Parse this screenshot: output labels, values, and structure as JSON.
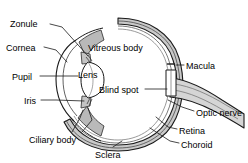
{
  "diagram": {
    "type": "anatomical-cross-section",
    "colors": {
      "outline": "#1a1a1a",
      "wall_fill": "#c8c8c8",
      "interior_fill": "#ffffff",
      "lens_fill": "#ffffff",
      "iris_fill": "#b4b4b4",
      "nerve_fill": "#d2d2d2",
      "text": "#000000",
      "background": "#ffffff"
    },
    "labels": [
      {
        "id": "zonule",
        "text": "Zonule",
        "x": 10,
        "y": 19,
        "align": "left"
      },
      {
        "id": "cornea",
        "text": "Cornea",
        "x": 6,
        "y": 43,
        "align": "left"
      },
      {
        "id": "pupil",
        "text": "Pupil",
        "x": 12,
        "y": 72,
        "align": "left"
      },
      {
        "id": "iris",
        "text": "Iris",
        "x": 24,
        "y": 96,
        "align": "left"
      },
      {
        "id": "ciliary",
        "text": "Ciliary body",
        "x": 29,
        "y": 135,
        "align": "left"
      },
      {
        "id": "sclera",
        "text": "Sclera",
        "x": 95,
        "y": 150,
        "align": "left"
      },
      {
        "id": "vitreous",
        "text": "Vitreous body",
        "x": 88,
        "y": 43,
        "align": "left"
      },
      {
        "id": "lens",
        "text": "Lens",
        "x": 78,
        "y": 70,
        "align": "left"
      },
      {
        "id": "blindspot",
        "text": "Blind spot",
        "x": 99,
        "y": 85,
        "align": "left"
      },
      {
        "id": "macula",
        "text": "Macula",
        "x": 186,
        "y": 61,
        "align": "left"
      },
      {
        "id": "opticnerve",
        "text": "Optic nerve",
        "x": 196,
        "y": 108,
        "align": "left"
      },
      {
        "id": "retina",
        "text": "Retina",
        "x": 179,
        "y": 126,
        "align": "left"
      },
      {
        "id": "choroid",
        "text": "Choroid",
        "x": 181,
        "y": 140,
        "align": "left"
      }
    ]
  }
}
